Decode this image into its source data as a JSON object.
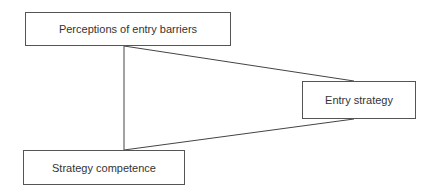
{
  "diagram": {
    "nodes": [
      {
        "id": "top",
        "label": "Perceptions of entry barriers"
      },
      {
        "id": "right",
        "label": "Entry strategy"
      },
      {
        "id": "bottom",
        "label": "Strategy competence"
      }
    ],
    "edges": [
      {
        "from": "top",
        "to": "bottom"
      },
      {
        "from": "top",
        "to": "right"
      },
      {
        "from": "bottom",
        "to": "right"
      }
    ],
    "line_color": "#444444"
  }
}
